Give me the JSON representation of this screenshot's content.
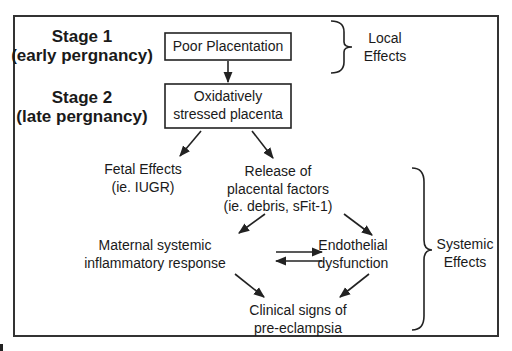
{
  "diagram": {
    "stages": [
      {
        "title": "Stage 1",
        "subtitle": "(early pergnancy)"
      },
      {
        "title": "Stage 2",
        "subtitle": "(late pergnancy)"
      }
    ],
    "boxes": {
      "poor_placentation": "Poor Placentation",
      "stressed_placenta": [
        "Oxidatively",
        "stressed placenta"
      ]
    },
    "nodes": {
      "fetal_effects": [
        "Fetal Effects",
        "(ie. IUGR)"
      ],
      "release_factors": [
        "Release of",
        "placental factors",
        "(ie. debris, sFit-1)"
      ],
      "maternal_response": [
        "Maternal systemic",
        "inflammatory response"
      ],
      "endothelial": [
        "Endothelial",
        "dysfunction"
      ],
      "clinical_signs": [
        "Clinical signs of",
        "pre-eclampsia"
      ]
    },
    "braces": {
      "local": [
        "Local",
        "Effects"
      ],
      "systemic": [
        "Systemic",
        "Effects"
      ]
    },
    "edges": [
      {
        "from": "Poor Placentation",
        "to": "Oxidatively stressed placenta"
      },
      {
        "from": "Oxidatively stressed placenta",
        "to": "Fetal Effects"
      },
      {
        "from": "Oxidatively stressed placenta",
        "to": "Release of placental factors"
      },
      {
        "from": "Release of placental factors",
        "to": "Maternal systemic inflammatory response"
      },
      {
        "from": "Release of placental factors",
        "to": "Endothelial dysfunction"
      },
      {
        "from": "Maternal systemic inflammatory response",
        "to": "Endothelial dysfunction",
        "bidirectional": true
      },
      {
        "from": "Maternal systemic inflammatory response",
        "to": "Clinical signs of pre-eclampsia"
      },
      {
        "from": "Endothelial dysfunction",
        "to": "Clinical signs of pre-eclampsia"
      }
    ],
    "colors": {
      "stroke": "#222222",
      "text": "#1a1a1a",
      "background": "#ffffff"
    }
  }
}
